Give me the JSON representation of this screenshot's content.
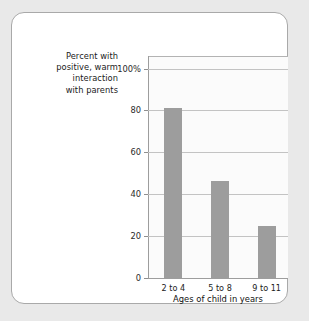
{
  "chart_data": {
    "type": "bar",
    "title": "",
    "categories": [
      "2 to 4",
      "5 to 8",
      "9 to 11"
    ],
    "values": [
      81,
      46.5,
      25
    ],
    "series": [
      {
        "name": "Percent with positive, warm interaction with parents",
        "values": [
          81,
          46.5,
          25
        ]
      }
    ],
    "xlabel": "Ages of child in years",
    "ylabel": "Percent with positive, warm interaction with parents",
    "ylim": [
      0,
      106
    ],
    "yticks": [
      0,
      20,
      40,
      60,
      80,
      100
    ],
    "ytick_labels": [
      "0",
      "20",
      "40",
      "60",
      "80",
      "100%"
    ],
    "grid": true,
    "legend": "none",
    "bar_color": "#9d9d9d",
    "gridline_color": "#c3c3c3",
    "panel_background": "#fbfbfb"
  },
  "card": {
    "background": "#ffffff",
    "border_color": "#a9a9a9"
  },
  "page": {
    "background": "#e9e9e9"
  },
  "y_axis_caption": {
    "line1": "Percent with",
    "line2": "positive, warm",
    "line3": "interaction",
    "line4": "with parents"
  }
}
